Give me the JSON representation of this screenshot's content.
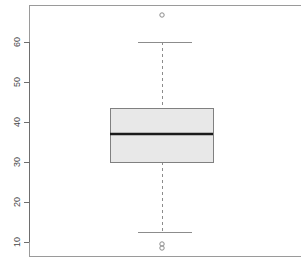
{
  "chart_data": {
    "type": "box",
    "title": "",
    "xlabel": "",
    "ylabel": "",
    "ylim": [
      6,
      69
    ],
    "grid": false,
    "legend": false,
    "orientation": "vertical",
    "y_ticks": [
      10,
      20,
      30,
      40,
      50,
      60
    ],
    "y_tick_labels": [
      "10",
      "20",
      "30",
      "40",
      "50",
      "60"
    ],
    "boxes": [
      {
        "name": "",
        "min_whisker": 12.5,
        "q1": 30,
        "median": 37,
        "q3": 43.5,
        "max_whisker": 60,
        "outliers": [
          66.75,
          9.5,
          8.5
        ]
      }
    ],
    "colors": {
      "box_fill": "#e8e8e8",
      "box_edge": "#808080",
      "median": "#1a1a1a",
      "whisker": "#8c8c8c",
      "cap": "#8c8c8c",
      "outlier": "#8c8c8c",
      "frame": "#9a9a9a",
      "axis": "#6e6e6e",
      "tick_text": "#4a4a4a",
      "background": "#ffffff"
    }
  },
  "figure": {
    "frame": {
      "left": 29,
      "top": 5,
      "right": 300,
      "bottom": 256
    },
    "plot_area": {
      "x0": 29,
      "y0": 5,
      "x1": 300,
      "y1": 256
    },
    "y_axis": {
      "x": 29,
      "y_top": 42,
      "y_bottom": 242,
      "tick_length": 5
    },
    "box_geom": {
      "x_left": 110,
      "x_right": 213,
      "center": 162
    },
    "cap_geom": {
      "x_left": 138,
      "x_right": 192
    }
  }
}
